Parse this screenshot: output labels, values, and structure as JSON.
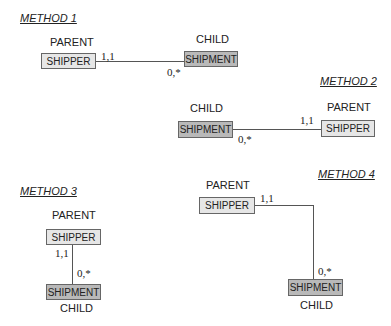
{
  "methods": [
    {
      "title": "METHOD 1",
      "parent_role": "PARENT",
      "child_role": "CHILD",
      "parent_entity": "SHIPPER",
      "child_entity": "SHIPMENT",
      "parent_cardinality": "1,1",
      "child_cardinality": "0,*"
    },
    {
      "title": "METHOD 2",
      "parent_role": "PARENT",
      "child_role": "CHILD",
      "parent_entity": "SHIPPER",
      "child_entity": "SHIPMENT",
      "parent_cardinality": "1,1",
      "child_cardinality": "0,*"
    },
    {
      "title": "METHOD 3",
      "parent_role": "PARENT",
      "child_role": "CHILD",
      "parent_entity": "SHIPPER",
      "child_entity": "SHIPMENT",
      "parent_cardinality": "1,1",
      "child_cardinality": "0,*"
    },
    {
      "title": "METHOD 4",
      "parent_role": "PARENT",
      "child_role": "CHILD",
      "parent_entity": "SHIPPER",
      "child_entity": "SHIPMENT",
      "parent_cardinality": "1,1",
      "child_cardinality": "0,*"
    }
  ],
  "colors": {
    "parent_fill": "#e6e6e6",
    "child_fill": "#b9b9b9",
    "line": "#555555"
  }
}
